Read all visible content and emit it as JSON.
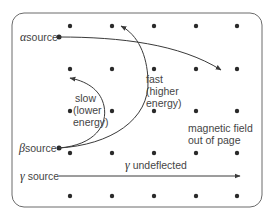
{
  "diagram": {
    "colors": {
      "line": "#3a3a3a",
      "box": "#6a6a6a",
      "dot": "#2a2a2a",
      "background": "#ffffff"
    },
    "field": {
      "label_line1": "magnetic field",
      "label_line2": "out of page",
      "dot_grid": {
        "columns": [
          70,
          112,
          154,
          196,
          237
        ],
        "rows": [
          26,
          69,
          111,
          153,
          196
        ]
      }
    },
    "sources": {
      "alpha": {
        "symbol": "α",
        "label": "source"
      },
      "beta": {
        "symbol": "β",
        "label": "source"
      },
      "gamma": {
        "symbol": "γ",
        "label": "source"
      }
    },
    "paths": {
      "fast": {
        "line1": "fast",
        "line2": "(higher",
        "line3": "energy)"
      },
      "slow": {
        "line1": "slow",
        "line2": "(lower",
        "line3": "energy)"
      },
      "gamma": {
        "symbol": "γ",
        "label": "undeflected"
      }
    }
  }
}
